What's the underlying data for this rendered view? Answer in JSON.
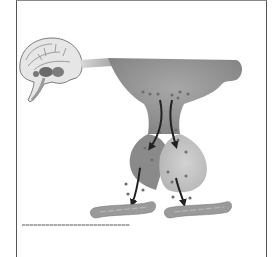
{
  "figure": {
    "type": "diagram",
    "components": [
      {
        "id": "brain",
        "label": "brain-sagittal-section"
      },
      {
        "id": "hypothalamus",
        "label": "hypothalamus"
      },
      {
        "id": "pituitary-stalk",
        "label": "pituitary-stalk"
      },
      {
        "id": "pituitary-anterior",
        "label": "anterior-pituitary"
      },
      {
        "id": "pituitary-posterior",
        "label": "posterior-pituitary"
      },
      {
        "id": "blood-vessel-left",
        "label": "blood-vessel"
      },
      {
        "id": "blood-vessel-right",
        "label": "blood-vessel"
      }
    ],
    "arrows": 4,
    "caption": ""
  },
  "colors": {
    "frame": "#555555",
    "hypothalamus": "#8f8f8f",
    "pituitary_dark": "#8a8a8a",
    "pituitary_light": "#c4c4c4",
    "vessel": "#999999",
    "arrow": "#222222",
    "particle": "#6e6e6e"
  }
}
